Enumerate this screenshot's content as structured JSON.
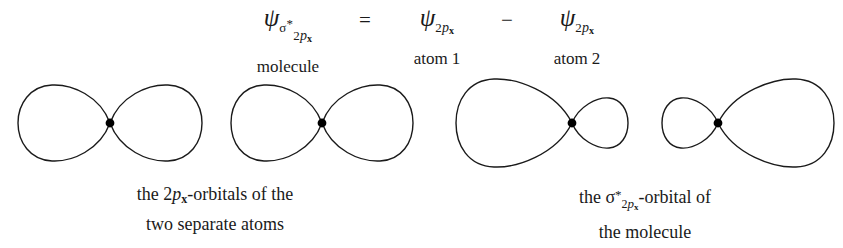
{
  "figure": {
    "background_color": "#ffffff",
    "stroke_color": "#1a1a1a",
    "nucleus_color": "#000000"
  },
  "equation": {
    "lhs": {
      "symbol": "ψ",
      "subscript_sigma": "σ",
      "subscript_star": "*",
      "subscript_n": "2",
      "subscript_p": "p",
      "subscript_x": "x",
      "label": "molecule"
    },
    "operator_equals": "=",
    "term1": {
      "symbol": "ψ",
      "subscript_n": "2",
      "subscript_p": "p",
      "subscript_x": "x",
      "label": "atom 1"
    },
    "operator_minus": "−",
    "term2": {
      "symbol": "ψ",
      "subscript_n": "2",
      "subscript_p": "p",
      "subscript_x": "x",
      "label": "atom 2"
    }
  },
  "orbitals": [
    {
      "name": "atom-1-2px-orbital",
      "type": "symmetric-dumbbell",
      "left_lobe_size": "large",
      "right_lobe_size": "large"
    },
    {
      "name": "atom-2-2px-orbital",
      "type": "symmetric-dumbbell",
      "left_lobe_size": "large",
      "right_lobe_size": "large"
    },
    {
      "name": "sigma-star-lobe-left",
      "type": "asymmetric-dumbbell",
      "left_lobe_size": "large",
      "right_lobe_size": "small"
    },
    {
      "name": "sigma-star-lobe-right",
      "type": "asymmetric-dumbbell",
      "left_lobe_size": "small",
      "right_lobe_size": "large"
    }
  ],
  "captions": {
    "left": {
      "line1_pre": "the ",
      "line1_n": "2",
      "line1_p": "p",
      "line1_x": "x",
      "line1_post": "-orbitals of the",
      "line2": "two separate atoms"
    },
    "right": {
      "line1_pre": "the ",
      "line1_sigma": "σ",
      "line1_star": "*",
      "line1_n": "2",
      "line1_p": "p",
      "line1_x": "x",
      "line1_post": "-orbital of",
      "line2": "the molecule"
    }
  }
}
